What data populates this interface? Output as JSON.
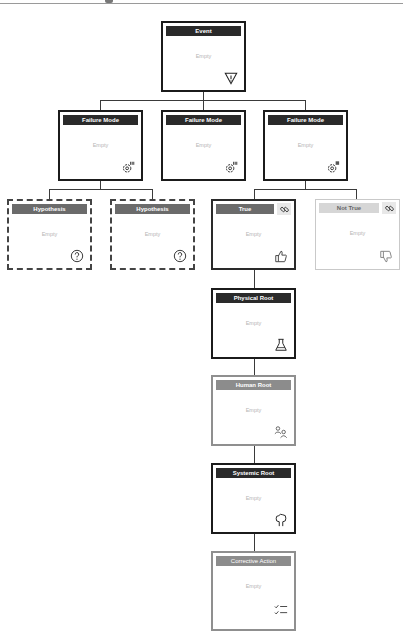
{
  "diagram": {
    "nodes": [
      {
        "id": "event",
        "title": "Event",
        "body": "Empty",
        "icon": "warning-triangle-icon"
      },
      {
        "id": "fm1",
        "title": "Failure Mode",
        "body": "Empty",
        "icon": "gear-list-icon"
      },
      {
        "id": "fm2",
        "title": "Failure Mode",
        "body": "Empty",
        "icon": "gear-list-icon"
      },
      {
        "id": "fm3",
        "title": "Failure Mode",
        "body": "Empty",
        "icon": "gear-list-icon"
      },
      {
        "id": "hyp1",
        "title": "Hypothesis",
        "body": "Empty",
        "icon": "question-circle-icon"
      },
      {
        "id": "hyp2",
        "title": "Hypothesis",
        "body": "Empty",
        "icon": "question-circle-icon"
      },
      {
        "id": "true",
        "title": "True",
        "body": "Empty",
        "icon": "thumbs-up-icon",
        "link_icon": "link-icon"
      },
      {
        "id": "nottrue",
        "title": "Not True",
        "body": "Empty",
        "icon": "thumbs-down-icon",
        "link_icon": "link-icon"
      },
      {
        "id": "physical",
        "title": "Physical Root",
        "body": "Empty",
        "icon": "flask-icon"
      },
      {
        "id": "human",
        "title": "Human Root",
        "body": "Empty",
        "icon": "people-icon"
      },
      {
        "id": "systemic",
        "title": "Systemic Root",
        "body": "Empty",
        "icon": "tree-icon"
      },
      {
        "id": "corrective",
        "title": "Corrective Action",
        "body": "Empty",
        "icon": "checklist-icon"
      }
    ]
  },
  "colors": {
    "title_dark": "#2a2a2a",
    "title_gray": "#6b6b6b",
    "title_light": "#d6d6d6",
    "border": "#1b1b1b",
    "connector": "#3a3a3a"
  }
}
